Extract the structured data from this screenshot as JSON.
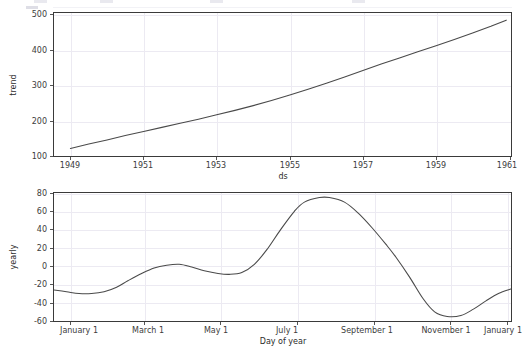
{
  "figure": {
    "background": "#ffffff",
    "line_color": "#4a4a4a",
    "grid_color": "#eceaf2",
    "axis_color": "#3a3a3a"
  },
  "chart_data": [
    {
      "type": "line",
      "name": "trend-component",
      "title": "",
      "xlabel": "ds",
      "ylabel": "trend",
      "grid": true,
      "legend": "none",
      "xlim": [
        1948.55,
        1961.05
      ],
      "ylim": [
        90,
        510
      ],
      "xticks": [
        1949,
        1951,
        1953,
        1955,
        1957,
        1959,
        1961
      ],
      "xtick_labels": [
        "1949",
        "1951",
        "1953",
        "1955",
        "1957",
        "1959",
        "1961"
      ],
      "yticks": [
        100,
        200,
        300,
        400,
        500
      ],
      "ytick_labels": [
        "100",
        "200",
        "300",
        "400",
        "500"
      ],
      "x": [
        1949.0,
        1949.5,
        1950.0,
        1950.5,
        1951.0,
        1951.5,
        1952.0,
        1952.5,
        1953.0,
        1953.5,
        1954.0,
        1954.5,
        1955.0,
        1955.5,
        1956.0,
        1956.5,
        1957.0,
        1957.5,
        1958.0,
        1958.5,
        1959.0,
        1959.5,
        1960.0,
        1960.5,
        1960.92
      ],
      "values": [
        112,
        125,
        137,
        150,
        162,
        174,
        186,
        198,
        211,
        224,
        238,
        253,
        269,
        286,
        304,
        322,
        341,
        360,
        378,
        396,
        414,
        432,
        451,
        471,
        489
      ]
    },
    {
      "type": "line",
      "name": "yearly-seasonality-component",
      "title": "",
      "xlabel": "Day of year",
      "ylabel": "yearly",
      "grid": true,
      "legend": "none",
      "xlim": [
        0,
        365
      ],
      "ylim": [
        -60,
        80
      ],
      "xticks": [
        0,
        59,
        120,
        181,
        243,
        304,
        365
      ],
      "xtick_labels": [
        "January 1",
        "March 1",
        "May 1",
        "July 1",
        "September 1",
        "November 1",
        "January 1"
      ],
      "yticks": [
        -60,
        -40,
        -20,
        0,
        20,
        40,
        60,
        80
      ],
      "ytick_labels": [
        "-60",
        "-40",
        "-20",
        "0",
        "20",
        "40",
        "60",
        "80"
      ],
      "x": [
        0,
        10,
        20,
        30,
        40,
        50,
        59,
        70,
        80,
        90,
        100,
        110,
        120,
        131,
        140,
        150,
        160,
        170,
        181,
        192,
        200,
        212,
        220,
        232,
        243,
        254,
        265,
        273,
        284,
        295,
        304,
        314,
        325,
        335,
        345,
        355,
        365
      ],
      "values": [
        -26,
        -28,
        -30,
        -30,
        -28,
        -23,
        -16,
        -8,
        -2,
        1,
        2,
        -1,
        -5,
        -8,
        -9,
        -7,
        2,
        18,
        40,
        60,
        70,
        75,
        75,
        70,
        58,
        42,
        24,
        10,
        -12,
        -36,
        -50,
        -55,
        -54,
        -47,
        -38,
        -30,
        -25
      ]
    }
  ],
  "top_artifact": {
    "blip_positions": [
      34,
      100,
      210,
      352
    ]
  }
}
